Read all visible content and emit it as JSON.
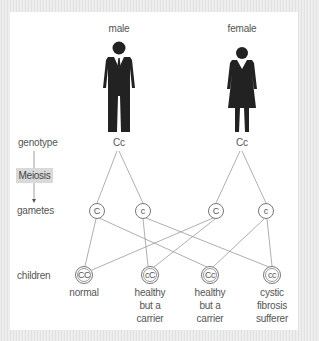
{
  "parents": [
    {
      "label": "male",
      "genotype": "Cc",
      "icon": "male-figure-icon"
    },
    {
      "label": "female",
      "genotype": "Cc",
      "icon": "female-figure-icon"
    }
  ],
  "row_labels": {
    "genotype": "genotype",
    "meiosis": "Meiosis",
    "gametes": "gametes",
    "children": "children"
  },
  "gametes": [
    {
      "allele": "C",
      "parent": "male"
    },
    {
      "allele": "c",
      "parent": "male"
    },
    {
      "allele": "C",
      "parent": "female"
    },
    {
      "allele": "c",
      "parent": "female"
    }
  ],
  "children": [
    {
      "genotype": "CC",
      "desc": [
        "normal"
      ]
    },
    {
      "genotype": "cC",
      "desc": [
        "healthy",
        "but a",
        "carrier"
      ]
    },
    {
      "genotype": "Cc",
      "desc": [
        "healthy",
        "but a",
        "carrier"
      ]
    },
    {
      "genotype": "cc",
      "desc": [
        "cystic",
        "fibrosis",
        "sufferer"
      ]
    }
  ],
  "colors": {
    "figure": "#222222",
    "line": "#999999",
    "text": "#555555",
    "meiosis_bg": "#d9d9d9"
  }
}
